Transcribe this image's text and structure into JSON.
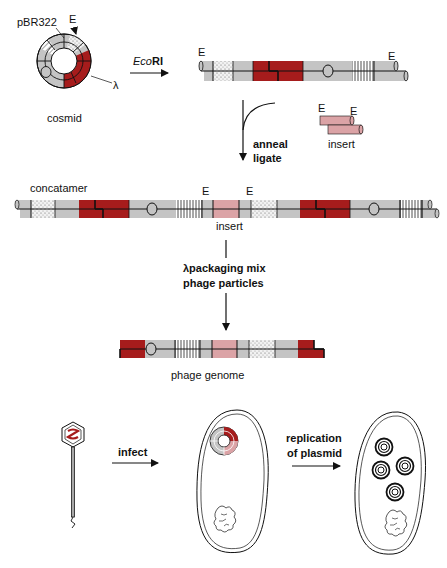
{
  "figure": {
    "colors": {
      "gray": "#c4c4c4",
      "lambda_red": "#a61c1c",
      "insert_pink": "#dba3a6",
      "line": "#111111",
      "background": "#ffffff"
    },
    "labels": {
      "pbr322": "pBR322",
      "ecori_site_top": "E",
      "lambda": "λ",
      "cosmid": "cosmid",
      "enzyme_italic": "Eco",
      "enzyme_bold": "RI",
      "linear_e_left": "E",
      "linear_e_right": "E",
      "insert_e_left": "E",
      "insert_e_right": "E",
      "insert": "insert",
      "anneal": "anneal",
      "ligate": "ligate",
      "concatamer": "concatamer",
      "concat_e_left": "E",
      "concat_e_right": "E",
      "concat_insert": "insert",
      "packaging_line1": "λpackaging mix",
      "packaging_line2": "phage particles",
      "phage_genome": "phage genome",
      "infect": "infect",
      "replication_line1": "replication",
      "replication_line2": "of plasmid"
    },
    "steps": [
      {
        "name": "cosmid",
        "desc": "circular cosmid with pBR322 and λ cos regions"
      },
      {
        "name": "EcoRI digestion",
        "desc": "linearized cosmid"
      },
      {
        "name": "anneal ligate",
        "desc": "concatamer with insert"
      },
      {
        "name": "λ packaging",
        "desc": "phage genome"
      },
      {
        "name": "infect",
        "desc": "cosmid injected into bacterium"
      },
      {
        "name": "replication of plasmid",
        "desc": "multiple plasmid copies"
      }
    ]
  }
}
